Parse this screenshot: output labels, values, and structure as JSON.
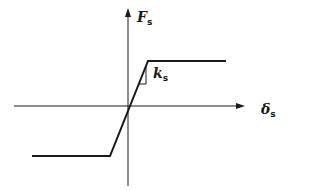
{
  "diagram": {
    "type": "force-displacement curve (elastic-perfectly-plastic)",
    "colors": {
      "line": "#1a1a1a",
      "background": "#ffffff"
    },
    "axes": {
      "vertical": {
        "label": "F",
        "subscript": "s"
      },
      "horizontal": {
        "label": "δ",
        "subscript": "s"
      }
    },
    "slope_label": {
      "label": "k",
      "subscript": "s"
    }
  }
}
